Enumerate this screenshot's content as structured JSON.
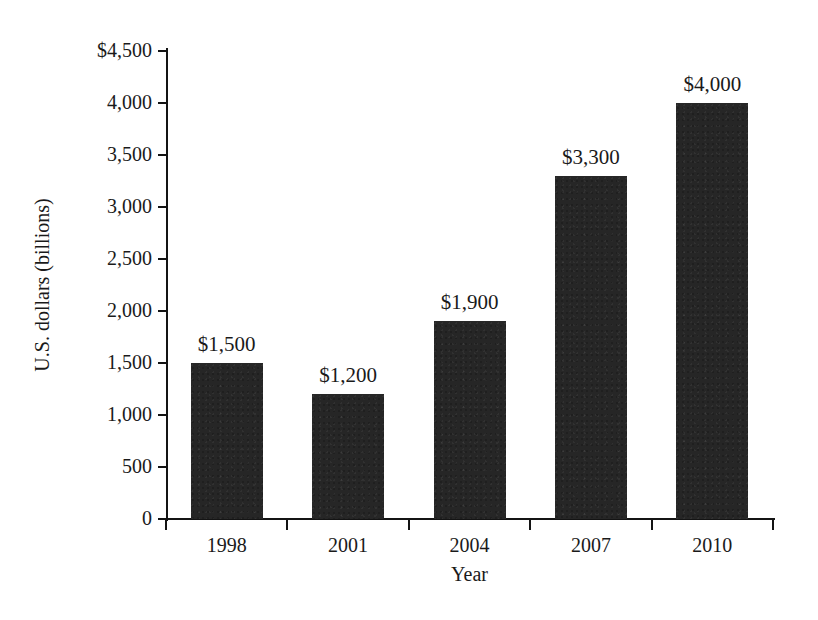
{
  "chart_data": {
    "type": "bar",
    "title": "",
    "xlabel": "Year",
    "ylabel": "U.S. dollars (billions)",
    "categories": [
      "1998",
      "2001",
      "2004",
      "2007",
      "2010"
    ],
    "values": [
      1500,
      1200,
      1900,
      3300,
      4000
    ],
    "data_labels": [
      "$1,500",
      "$1,200",
      "$1,900",
      "$3,300",
      "$4,000"
    ],
    "ylim": [
      0,
      4500
    ],
    "ytick_values": [
      0,
      500,
      1000,
      1500,
      2000,
      2500,
      3000,
      3500,
      4000,
      4500
    ],
    "ytick_labels": [
      "0",
      "500",
      "1,000",
      "1,500",
      "2,000",
      "2,500",
      "3,000",
      "3,500",
      "4,000",
      "$4,500"
    ],
    "grid": false,
    "legend": false,
    "bar_color": "#262626",
    "background_color": "#ffffff",
    "axis_color": "#141414"
  }
}
